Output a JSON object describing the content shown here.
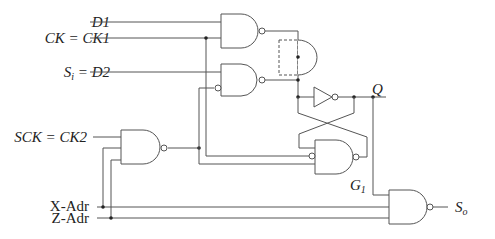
{
  "diagram": {
    "type": "logic-circuit",
    "inputs": [
      {
        "label": "D1"
      },
      {
        "label": "CK = CK1"
      },
      {
        "label": "S",
        "subscript": "i",
        "suffix": " = D2"
      },
      {
        "label": "SCK = CK2"
      },
      {
        "label": "X-Adr"
      },
      {
        "label": "Z-Adr"
      }
    ],
    "outputs": [
      {
        "label": "Q"
      },
      {
        "label": "S",
        "subscript": "o"
      }
    ],
    "gate_labels": [
      {
        "label": "G",
        "subscript": "1"
      }
    ],
    "gates": [
      {
        "id": "nand-d1",
        "type": "NAND",
        "inputs": [
          "D1",
          "CK"
        ]
      },
      {
        "id": "nand-d2",
        "type": "NAND",
        "inputs": [
          "D2",
          "NOT SCK-gate"
        ]
      },
      {
        "id": "and-merge",
        "type": "AND (dashed wired)",
        "inputs": [
          "nand-d1",
          "nand-d2"
        ]
      },
      {
        "id": "inverter",
        "type": "NOT",
        "inputs": [
          "and-merge"
        ],
        "output": "Q"
      },
      {
        "id": "g1",
        "type": "NAND",
        "label": "G1",
        "inputs": [
          "NOT CK",
          "NOT SCK-gate"
        ]
      },
      {
        "id": "nand-sck",
        "type": "NAND",
        "inputs": [
          "SCK",
          "X-Adr",
          "Z-Adr"
        ]
      },
      {
        "id": "nand-out",
        "type": "NAND",
        "inputs": [
          "Q",
          "X-Adr",
          "Z-Adr"
        ],
        "output": "So"
      }
    ]
  }
}
